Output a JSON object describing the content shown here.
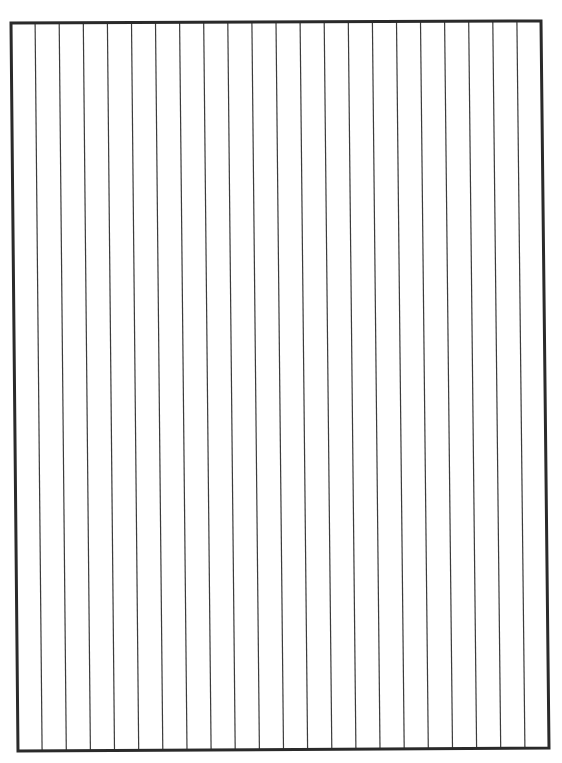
{
  "sheet": {
    "type": "vertically-ruled blank sheet",
    "background_color": "#ffffff",
    "ink_color": "#2a2a2a",
    "frame": {
      "top_left": [
        11,
        23
      ],
      "top_right": [
        541,
        21
      ],
      "bottom_right": [
        549,
        748
      ],
      "bottom_left": [
        18,
        751
      ],
      "stroke_width": 3
    },
    "rule_line_count": 21,
    "column_count": 22,
    "rule_stroke_width": 1.2,
    "rule_color": "#3c3c3c"
  }
}
